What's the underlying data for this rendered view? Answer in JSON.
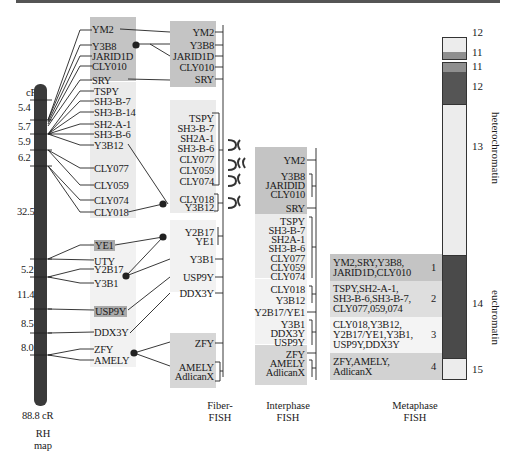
{
  "rh_map": {
    "unit_top": "cR",
    "distances": [
      "5.4",
      "5.7",
      "5.9",
      "6.2",
      "32.5",
      "5.2",
      "11.4",
      "8.5",
      "8.0"
    ],
    "total": "88.8 cR",
    "caption_line1": "RH",
    "caption_line2": "map",
    "markers": [
      "YM2",
      "Y3B8",
      "JARID1D",
      "CLY010",
      "SRY",
      "TSPY",
      "SH3-B-7",
      "SH3-B-14",
      "SH2-A-1",
      "SH3-B-6",
      "Y3B12",
      "CLY077",
      "CLY059",
      "CLY074",
      "CLY018",
      "YE1",
      "UTY",
      "Y2B17",
      "Y3B1",
      "USP9Y",
      "DDX3Y",
      "ZFY",
      "AMELY"
    ]
  },
  "fiber_fish": {
    "caption_line1": "Fiber-",
    "caption_line2": "FISH",
    "markers": [
      "YM2",
      "Y3B8",
      "JARID1D",
      "CLY010",
      "SRY",
      "TSPY",
      "SH3-B-7",
      "SH2A-1",
      "SH3-B-6",
      "CLY077",
      "CLY059",
      "CLY074",
      "CLY018",
      "Y3B12",
      "Y2B17",
      "YE1",
      "Y3B1",
      "USP9Y",
      "DDX3Y",
      "ZFY",
      "AMELY",
      "AdlicanX"
    ]
  },
  "interphase_fish": {
    "caption_line1": "Interphase",
    "caption_line2": "FISH",
    "markers": [
      "YM2",
      "Y3B8",
      "JARIDID",
      "CLY010",
      "SRY",
      "TSPY",
      "SH3-B-7",
      "SH2A-1",
      "SH3-B-6",
      "CLY077",
      "CLY059",
      "CLY074",
      "CLY018",
      "Y3B12",
      "Y2B17/YE1",
      "Y3B1",
      "DDX3Y",
      "USP9Y",
      "ZFY",
      "AMELY",
      "AdlicanX"
    ]
  },
  "metaphase_fish": {
    "caption_line1": "Metaphase",
    "caption_line2": "FISH",
    "groups": [
      {
        "num": "1",
        "line1": "YM2,SRY,Y3B8,",
        "line2": "JARID1D,CLY010",
        "line3": ""
      },
      {
        "num": "2",
        "line1": "TSPY,SH2-A-1,",
        "line2": "SH3-B-6,SH3-B-7,",
        "line3": "CLY077,059,074"
      },
      {
        "num": "3",
        "line1": "CLY018,Y3B12,",
        "line2": "Y2B17/YE1,Y3B1,",
        "line3": "USP9Y,DDX3Y"
      },
      {
        "num": "4",
        "line1": "ZFY,AMELY,",
        "line2": "AdlicanX",
        "line3": ""
      }
    ]
  },
  "ideogram": {
    "bands": [
      "12",
      "11",
      "11",
      "12",
      "13",
      "14",
      "15"
    ],
    "label_hetero": "heterochromatin",
    "label_eu": "euchromatin"
  },
  "colors": {
    "dark_box": "#c4c4c4",
    "mid_box": "#d6d6d6",
    "light_box": "#ebebeb",
    "chromosome": "#3a3a3a",
    "band_dark": "#4a4a4a"
  }
}
